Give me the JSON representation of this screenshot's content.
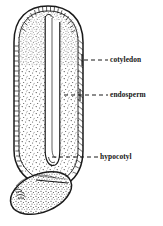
{
  "figure": {
    "background_color": "#ffffff",
    "ink_color": "#1a1a1a",
    "stipple_color": "#3a3a3a",
    "parts": [
      {
        "id": "seed-coat",
        "name": "seed coat outline",
        "description": "double-line elongated rounded body with hatched margin"
      },
      {
        "id": "endosperm-body",
        "name": "endosperm stippled tissue",
        "description": "dense stipple filling the main seed body"
      },
      {
        "id": "cotyledon-tube",
        "name": "cotyledon channel",
        "description": "narrow vertical U-shaped tube down the centre"
      },
      {
        "id": "hypocotyl-bulb",
        "name": "hypocotyl",
        "description": "tilted stippled oval protruding at lower left"
      }
    ]
  },
  "labels": [
    {
      "id": "cotyledon",
      "text": "cotyledon",
      "leader": {
        "style": "dashed",
        "from_x": 82,
        "from_y": 60,
        "to_x": 108,
        "to_y": 60,
        "tick": true
      }
    },
    {
      "id": "endosperm",
      "text": "endosperm",
      "leader": {
        "style": "dashed",
        "from_x": 64,
        "from_y": 95,
        "to_x": 108,
        "to_y": 95,
        "tick": true
      }
    },
    {
      "id": "hypocotyl",
      "text": "hypocotyl",
      "leader": {
        "style": "dashed",
        "from_x": 52,
        "from_y": 157,
        "to_x": 98,
        "to_y": 157,
        "tick": false
      }
    }
  ]
}
